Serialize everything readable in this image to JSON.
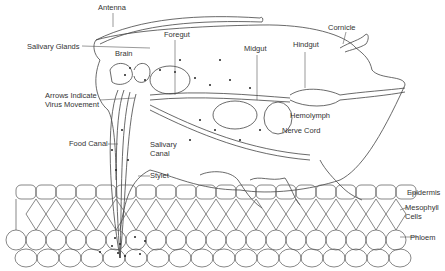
{
  "diagram": {
    "labels": {
      "antenna": "Antenna",
      "cornicle": "Cornicle",
      "salivary_glands": "Salivary Glands",
      "brain": "Brain",
      "foregut": "Foregut",
      "midgut": "Midgut",
      "hindgut": "Hindgut",
      "arrows_line1": "Arrows Indicate",
      "arrows_line2": "Virus Movement",
      "hemolymph": "Hemolymph",
      "nerve_cord": "Nerve Cord",
      "food_canal": "Food Canal",
      "salivary_canal_line1": "Salivary",
      "salivary_canal_line2": "Canal",
      "stylet": "Stylet",
      "epidermis": "Epidermis",
      "mesophyll_line1": "Mesophyll",
      "mesophyll_line2": "Cells",
      "phloem": "Phloem"
    },
    "line_color": "#444444"
  }
}
